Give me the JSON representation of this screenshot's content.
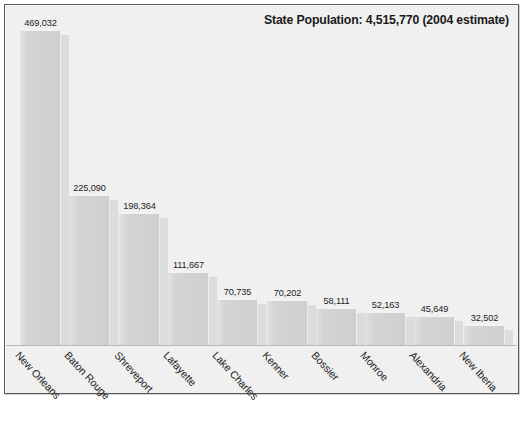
{
  "chart_data": {
    "type": "bar",
    "title": "State Population: 4,515,770 (2004 estimate)",
    "xlabel": "",
    "ylabel": "",
    "ylim": [
      0,
      469032
    ],
    "grid": false,
    "legend": false,
    "orientation": "vertical",
    "categories": [
      "New Orleans",
      "Baton Rouge",
      "Shreveport",
      "Lafayette",
      "Lake Charles",
      "Kenner",
      "Bossier",
      "Monroe",
      "Alexandria",
      "New Iberia"
    ],
    "values": [
      469032,
      225090,
      198364,
      111667,
      70735,
      70202,
      58111,
      52163,
      45649,
      32502
    ],
    "value_labels": [
      "469,032",
      "225,090",
      "198,364",
      "111,667",
      "70,735",
      "70,202",
      "58,111",
      "52,163",
      "45,649",
      "32,502"
    ],
    "colors": {
      "bar_fill": "#d1d2d2",
      "bar_shadow": "#dcdcdc",
      "bar_top_highlight": "#f3f3f3",
      "plot_background": "#f0f0f0",
      "frame_border": "#58595b",
      "text": "#1a1a1a",
      "baseline": "#b9b9b9"
    }
  },
  "chart": {
    "title": "State Population: 4,515,770 (2004 estimate)",
    "bars": [
      {
        "label": "New Orleans",
        "value_label": "469,032"
      },
      {
        "label": "Baton Rouge",
        "value_label": "225,090"
      },
      {
        "label": "Shreveport",
        "value_label": "198,364"
      },
      {
        "label": "Lafayette",
        "value_label": "111,667"
      },
      {
        "label": "Lake Charles",
        "value_label": "70,735"
      },
      {
        "label": "Kenner",
        "value_label": "70,202"
      },
      {
        "label": "Bossier",
        "value_label": "58,111"
      },
      {
        "label": "Monroe",
        "value_label": "52,163"
      },
      {
        "label": "Alexandria",
        "value_label": "45,649"
      },
      {
        "label": "New Iberia",
        "value_label": "32,502"
      }
    ]
  }
}
